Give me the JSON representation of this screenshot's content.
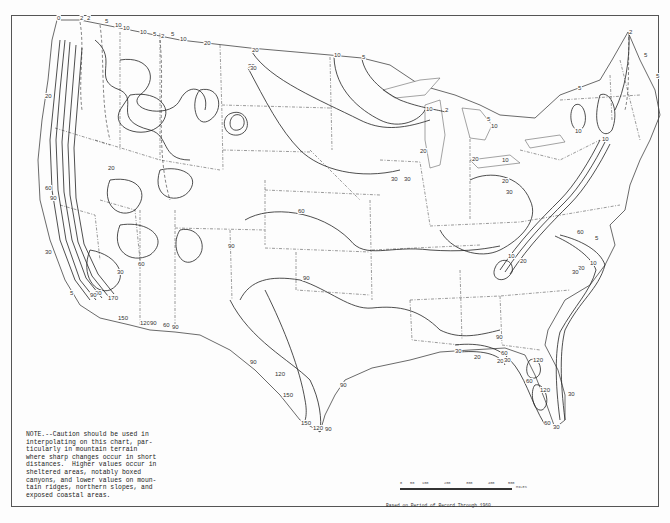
{
  "map": {
    "region": "Contiguous United States",
    "note": "NOTE.--Caution should be used in\ninterpolating on this chart, par-\nticularly in mountain terrain\nwhere sharp changes occur in short\ndistances.  Higher values occur in\nsheltered areas, notably boxed\ncanyons, and lower values on moun-\ntain ridges, northern slopes, and\nexposed coastal areas.",
    "source": "Based on Period of Record Through 1960.",
    "scale": {
      "ticks": [
        "0",
        "50",
        "100",
        "200",
        "300",
        "400",
        "500"
      ],
      "units": "MILES"
    },
    "isoline_values": [
      0,
      2,
      5,
      10,
      20,
      30,
      60,
      90,
      120,
      150
    ],
    "labels": [
      {
        "text": "0",
        "x": 57,
        "y": 20
      },
      {
        "text": "2",
        "x": 80,
        "y": 20
      },
      {
        "text": "2",
        "x": 87,
        "y": 20
      },
      {
        "text": "5",
        "x": 105,
        "y": 23
      },
      {
        "text": "10",
        "x": 115,
        "y": 27
      },
      {
        "text": "10",
        "x": 123,
        "y": 30
      },
      {
        "text": "10",
        "x": 140,
        "y": 34
      },
      {
        "text": "5",
        "x": 153,
        "y": 36
      },
      {
        "text": "2",
        "x": 161,
        "y": 38
      },
      {
        "text": "5",
        "x": 171,
        "y": 36
      },
      {
        "text": "10",
        "x": 180,
        "y": 41
      },
      {
        "text": "20",
        "x": 204,
        "y": 45
      },
      {
        "text": "20",
        "x": 252,
        "y": 52
      },
      {
        "text": "30",
        "x": 248,
        "y": 68
      },
      {
        "text": "30",
        "x": 250,
        "y": 70
      },
      {
        "text": "10",
        "x": 334,
        "y": 57
      },
      {
        "text": "5",
        "x": 362,
        "y": 59
      },
      {
        "text": "10",
        "x": 426,
        "y": 111
      },
      {
        "text": "2",
        "x": 445,
        "y": 112
      },
      {
        "text": "5",
        "x": 487,
        "y": 121
      },
      {
        "text": "10",
        "x": 491,
        "y": 128
      },
      {
        "text": "20",
        "x": 472,
        "y": 161
      },
      {
        "text": "20",
        "x": 420,
        "y": 153
      },
      {
        "text": "30",
        "x": 391,
        "y": 181
      },
      {
        "text": "10",
        "x": 502,
        "y": 162
      },
      {
        "text": "5",
        "x": 578,
        "y": 90
      },
      {
        "text": "10",
        "x": 575,
        "y": 133
      },
      {
        "text": "10",
        "x": 602,
        "y": 141
      },
      {
        "text": "2",
        "x": 629,
        "y": 34
      },
      {
        "text": "5",
        "x": 644,
        "y": 57
      },
      {
        "text": "5",
        "x": 656,
        "y": 78
      },
      {
        "text": "20",
        "x": 502,
        "y": 183
      },
      {
        "text": "30",
        "x": 506,
        "y": 194
      },
      {
        "text": "60",
        "x": 298,
        "y": 213
      },
      {
        "text": "90",
        "x": 303,
        "y": 280
      },
      {
        "text": "30",
        "x": 404,
        "y": 181
      },
      {
        "text": "60",
        "x": 577,
        "y": 234
      },
      {
        "text": "10",
        "x": 508,
        "y": 258
      },
      {
        "text": "20",
        "x": 520,
        "y": 263
      },
      {
        "text": "5",
        "x": 595,
        "y": 240
      },
      {
        "text": "10",
        "x": 590,
        "y": 265
      },
      {
        "text": "20",
        "x": 578,
        "y": 270
      },
      {
        "text": "30",
        "x": 572,
        "y": 274
      },
      {
        "text": "90",
        "x": 496,
        "y": 339
      },
      {
        "text": "30",
        "x": 455,
        "y": 353
      },
      {
        "text": "60",
        "x": 501,
        "y": 355
      },
      {
        "text": "20",
        "x": 474,
        "y": 359
      },
      {
        "text": "20",
        "x": 497,
        "y": 363
      },
      {
        "text": "30",
        "x": 504,
        "y": 362
      },
      {
        "text": "120",
        "x": 533,
        "y": 362
      },
      {
        "text": "60",
        "x": 526,
        "y": 383
      },
      {
        "text": "120",
        "x": 540,
        "y": 392
      },
      {
        "text": "30",
        "x": 568,
        "y": 396
      },
      {
        "text": "60",
        "x": 544,
        "y": 425
      },
      {
        "text": "30",
        "x": 553,
        "y": 429
      },
      {
        "text": "90",
        "x": 250,
        "y": 364
      },
      {
        "text": "120",
        "x": 275,
        "y": 376
      },
      {
        "text": "150",
        "x": 283,
        "y": 397
      },
      {
        "text": "150",
        "x": 301,
        "y": 425
      },
      {
        "text": "120",
        "x": 313,
        "y": 430
      },
      {
        "text": "90",
        "x": 325,
        "y": 431
      },
      {
        "text": "90",
        "x": 340,
        "y": 387
      },
      {
        "text": "150",
        "x": 118,
        "y": 320
      },
      {
        "text": "170",
        "x": 108,
        "y": 300
      },
      {
        "text": "120",
        "x": 140,
        "y": 325
      },
      {
        "text": "90",
        "x": 150,
        "y": 325
      },
      {
        "text": "60",
        "x": 163,
        "y": 327
      },
      {
        "text": "90",
        "x": 172,
        "y": 329
      },
      {
        "text": "60",
        "x": 95,
        "y": 295
      },
      {
        "text": "90",
        "x": 90,
        "y": 297
      },
      {
        "text": "5",
        "x": 70,
        "y": 295
      },
      {
        "text": "60",
        "x": 45,
        "y": 190
      },
      {
        "text": "90",
        "x": 50,
        "y": 200
      },
      {
        "text": "20",
        "x": 45,
        "y": 98
      },
      {
        "text": "30",
        "x": 45,
        "y": 254
      },
      {
        "text": "60",
        "x": 138,
        "y": 266
      },
      {
        "text": "90",
        "x": 228,
        "y": 248
      },
      {
        "text": "20",
        "x": 108,
        "y": 170
      },
      {
        "text": "30",
        "x": 117,
        "y": 274
      }
    ]
  }
}
